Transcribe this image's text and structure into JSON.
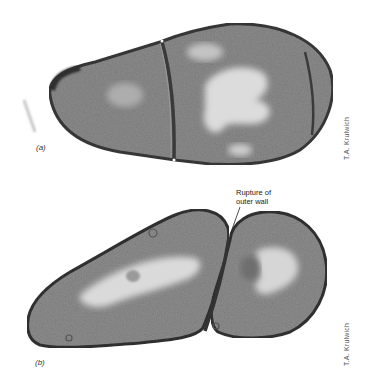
{
  "figure": {
    "panels": [
      {
        "label": "(a)",
        "credit": "T.A. Krulwich",
        "description": "Electron micrograph of a cell with two septa dividing it into compartments"
      },
      {
        "label": "(b)",
        "credit": "T.A. Krulwich",
        "description": "Electron micrograph of a dividing cell pair joined at septum",
        "annotation_line1": "Rupture of",
        "annotation_line2": "outer wall"
      }
    ],
    "colors": {
      "background": "#ffffff",
      "cell_wall": "#3a3a3a",
      "cytoplasm": "#8a8a8a",
      "nucleoid": "#d8d8d8"
    }
  }
}
